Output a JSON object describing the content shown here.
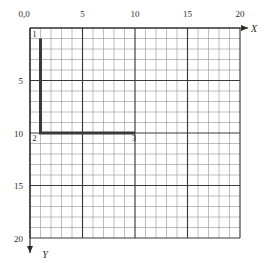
{
  "figure": {
    "origin_label": "0,0",
    "x_axis": {
      "name": "X",
      "direction": "right",
      "ticks": [
        {
          "value": 5,
          "label": "5"
        },
        {
          "value": 10,
          "label": "10"
        },
        {
          "value": 15,
          "label": "15"
        },
        {
          "value": 20,
          "label": "20"
        }
      ]
    },
    "y_axis": {
      "name": "Y",
      "direction": "down",
      "ticks": [
        {
          "value": 5,
          "label": "5"
        },
        {
          "value": 10,
          "label": "10"
        },
        {
          "value": 15,
          "label": "15"
        },
        {
          "value": 20,
          "label": "20"
        }
      ]
    },
    "grid": {
      "minor_step": 1,
      "major_step": 5,
      "x_range": [
        0,
        20
      ],
      "y_range": [
        0,
        20
      ],
      "minor_color": "#9a9a9a",
      "major_color": "#3a3a3a"
    },
    "path": {
      "stroke_color": "#3a3a3a",
      "points": [
        {
          "id": "1",
          "x": 1,
          "y": 1
        },
        {
          "id": "2",
          "x": 1,
          "y": 10
        },
        {
          "id": "3",
          "x": 10,
          "y": 10
        }
      ]
    }
  },
  "chart_data": {
    "type": "line",
    "title": "",
    "xlabel": "X",
    "ylabel": "Y",
    "xlim": [
      0,
      20
    ],
    "ylim": [
      0,
      20
    ],
    "y_axis_inverted": true,
    "grid": true,
    "legend": "none",
    "series": [
      {
        "name": "polyline",
        "x": [
          1,
          1,
          10
        ],
        "y": [
          1,
          10,
          10
        ],
        "point_labels": [
          "1",
          "2",
          "3"
        ]
      }
    ],
    "xticks": [
      0,
      5,
      10,
      15,
      20
    ],
    "yticks": [
      0,
      5,
      10,
      15,
      20
    ],
    "xticklabels": [
      "0,0",
      "5",
      "10",
      "15",
      "20"
    ],
    "yticklabels": [
      "0,0",
      "5",
      "10",
      "15",
      "20"
    ]
  }
}
